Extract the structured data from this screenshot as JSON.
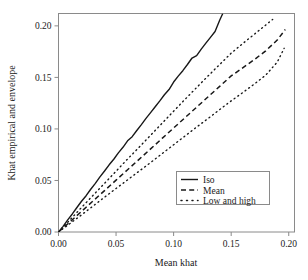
{
  "chart_data": {
    "type": "line",
    "title": "",
    "xlabel": "Mean khat",
    "ylabel": "Khat empirical and envelope",
    "xlim": [
      0.0,
      0.205
    ],
    "ylim": [
      0.0,
      0.212
    ],
    "grid": false,
    "legend_position": "lower-right-inside",
    "xticks": [
      "0.00",
      "0.05",
      "0.10",
      "0.15",
      "0.20"
    ],
    "xtick_values": [
      0.0,
      0.05,
      0.1,
      0.15,
      0.2
    ],
    "yticks": [
      "0.00",
      "0.05",
      "0.10",
      "0.15",
      "0.20"
    ],
    "ytick_values": [
      0.0,
      0.05,
      0.1,
      0.15,
      0.2
    ],
    "series": [
      {
        "name": "Iso",
        "style": "solid",
        "color": "#181818",
        "x": [
          0.0,
          0.004,
          0.008,
          0.012,
          0.016,
          0.02,
          0.024,
          0.028,
          0.032,
          0.036,
          0.04,
          0.044,
          0.048,
          0.052,
          0.056,
          0.06,
          0.064,
          0.068,
          0.072,
          0.076,
          0.08,
          0.084,
          0.088,
          0.092,
          0.096,
          0.1,
          0.104,
          0.108,
          0.112,
          0.116,
          0.12,
          0.124,
          0.128,
          0.132,
          0.136,
          0.14,
          0.1425
        ],
        "y": [
          0.0,
          0.0055,
          0.0118,
          0.0175,
          0.0238,
          0.0298,
          0.0352,
          0.0415,
          0.0472,
          0.0535,
          0.0592,
          0.0652,
          0.0706,
          0.0768,
          0.0822,
          0.0885,
          0.0925,
          0.0985,
          0.1042,
          0.1102,
          0.1158,
          0.1215,
          0.1272,
          0.1332,
          0.1382,
          0.1455,
          0.1512,
          0.1565,
          0.1625,
          0.1688,
          0.1712,
          0.1775,
          0.1832,
          0.1888,
          0.1945,
          0.2055,
          0.2115
        ]
      },
      {
        "name": "Mean",
        "style": "dashed",
        "color": "#181818",
        "x": [
          0.0,
          0.01,
          0.02,
          0.03,
          0.04,
          0.05,
          0.06,
          0.07,
          0.08,
          0.09,
          0.1,
          0.11,
          0.12,
          0.13,
          0.14,
          0.15,
          0.16,
          0.17,
          0.18,
          0.19,
          0.197
        ],
        "y": [
          0.0,
          0.0098,
          0.0199,
          0.0301,
          0.0402,
          0.0503,
          0.0604,
          0.0705,
          0.0806,
          0.0908,
          0.1009,
          0.111,
          0.1211,
          0.1312,
          0.1413,
          0.1514,
          0.1592,
          0.1672,
          0.1758,
          0.1862,
          0.1965
        ]
      },
      {
        "name": "Low and high",
        "style": "dotted",
        "color": "#181818",
        "bands": [
          {
            "edge": "high",
            "x": [
              0.0,
              0.01,
              0.02,
              0.03,
              0.04,
              0.05,
              0.06,
              0.07,
              0.08,
              0.09,
              0.1,
              0.11,
              0.12,
              0.13,
              0.14,
              0.15,
              0.16,
              0.17,
              0.18,
              0.186
            ],
            "y": [
              0.0,
              0.0118,
              0.0238,
              0.0355,
              0.0472,
              0.059,
              0.0708,
              0.0822,
              0.0938,
              0.1055,
              0.1172,
              0.1288,
              0.1402,
              0.1515,
              0.1625,
              0.1735,
              0.1828,
              0.1918,
              0.2008,
              0.2062
            ]
          },
          {
            "edge": "low",
            "x": [
              0.0,
              0.01,
              0.02,
              0.03,
              0.04,
              0.05,
              0.06,
              0.07,
              0.08,
              0.09,
              0.1,
              0.11,
              0.12,
              0.13,
              0.14,
              0.15,
              0.16,
              0.17,
              0.18,
              0.19,
              0.196
            ],
            "y": [
              0.0,
              0.0082,
              0.0166,
              0.0252,
              0.0338,
              0.0422,
              0.0506,
              0.059,
              0.0674,
              0.076,
              0.0846,
              0.0932,
              0.1018,
              0.1102,
              0.1188,
              0.1272,
              0.1352,
              0.1435,
              0.1522,
              0.1648,
              0.1782
            ]
          }
        ]
      }
    ],
    "legend_entries": [
      {
        "label": "Iso",
        "style": "solid"
      },
      {
        "label": "Mean",
        "style": "dashed"
      },
      {
        "label": "Low and high",
        "style": "dotted"
      }
    ]
  },
  "axes": {
    "x_title": "Mean khat",
    "y_title": "Khat empirical and envelope",
    "x_tick_labels": [
      "0.00",
      "0.05",
      "0.10",
      "0.15",
      "0.20"
    ],
    "y_tick_labels": [
      "0.00",
      "0.05",
      "0.10",
      "0.15",
      "0.20"
    ]
  },
  "legend": {
    "item_0_label": "Iso",
    "item_1_label": "Mean",
    "item_2_label": "Low and high"
  },
  "colors": {
    "line": "#181818",
    "frame": "#8a8a8a",
    "background": "#ffffff"
  }
}
